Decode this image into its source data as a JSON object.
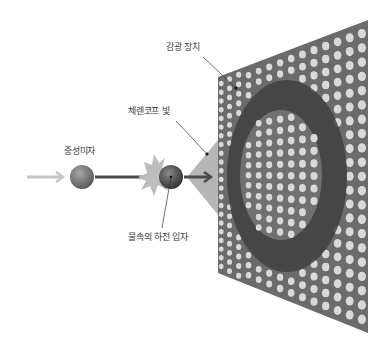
{
  "labels": {
    "photodetector": "감광 장치",
    "cherenkov_light": "체렌코프 빛",
    "neutrino": "중성미자",
    "charged_particle": "물속의 하전 입자"
  },
  "colors": {
    "background": "#ffffff",
    "panel": "#6b6b6b",
    "panel_dot": "#d9d9d9",
    "ring": "#3f3f3f",
    "inner_disc": "#7a7a7a",
    "cone": "#a9a9a9",
    "incoming_arrow": "#c4c4c4",
    "beam_arrow": "#4a4a4a",
    "neutrino_ball": "#6e6e6e",
    "particle_ball": "#4c4c4c",
    "starburst": "#bdbdbd",
    "leader_line": "#333333",
    "label_text": "#3a3a3a"
  },
  "geometry": {
    "panel": {
      "tl": [
        218,
        77
      ],
      "tr": [
        368,
        20
      ],
      "br": [
        368,
        333
      ],
      "bl": [
        218,
        273
      ]
    },
    "ring_outer": {
      "cx": 287,
      "cy": 176,
      "rx": 60,
      "ry": 96
    },
    "ring_inner": {
      "cx": 281,
      "cy": 175,
      "rx": 41,
      "ry": 65
    },
    "cone": {
      "apex": [
        187,
        177
      ],
      "top": [
        218,
        140
      ],
      "bottom": [
        218,
        215
      ]
    },
    "neutrino": {
      "cx": 82,
      "cy": 177,
      "r": 12
    },
    "particle": {
      "cx": 171,
      "cy": 177,
      "r": 12
    }
  }
}
